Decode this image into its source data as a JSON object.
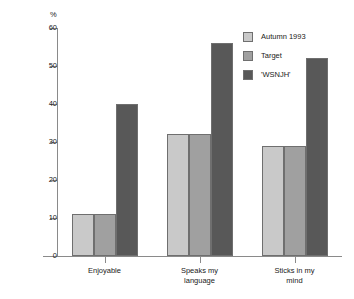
{
  "chart_data": {
    "type": "bar",
    "title": "",
    "xlabel": "",
    "ylabel": "%",
    "ylim": [
      0,
      60
    ],
    "yticks": [
      0,
      10,
      20,
      30,
      40,
      50,
      60
    ],
    "grid": false,
    "legend_position": "top-right",
    "categories": [
      "Enjoyable",
      "Speaks my language",
      "Sticks in my mind"
    ],
    "category_lines": [
      [
        "Enjoyable"
      ],
      [
        "Speaks my",
        "language"
      ],
      [
        "Sticks in my",
        "mind"
      ]
    ],
    "series": [
      {
        "name": "Autumn 1993",
        "color": "#c9c9c9",
        "values": [
          11,
          32,
          29
        ]
      },
      {
        "name": "Target",
        "color": "#a0a0a0",
        "values": [
          11,
          32,
          29
        ]
      },
      {
        "name": "'WSNJH'",
        "color": "#585858",
        "values": [
          40,
          56,
          52
        ]
      }
    ]
  },
  "axis": {
    "unit_label": "%",
    "tick_labels": [
      "0",
      "10",
      "20",
      "30",
      "40",
      "50",
      "60"
    ]
  },
  "legend": {
    "entries": [
      {
        "label": "Autumn 1993"
      },
      {
        "label": "Target"
      },
      {
        "label": "'WSNJH'"
      }
    ]
  }
}
